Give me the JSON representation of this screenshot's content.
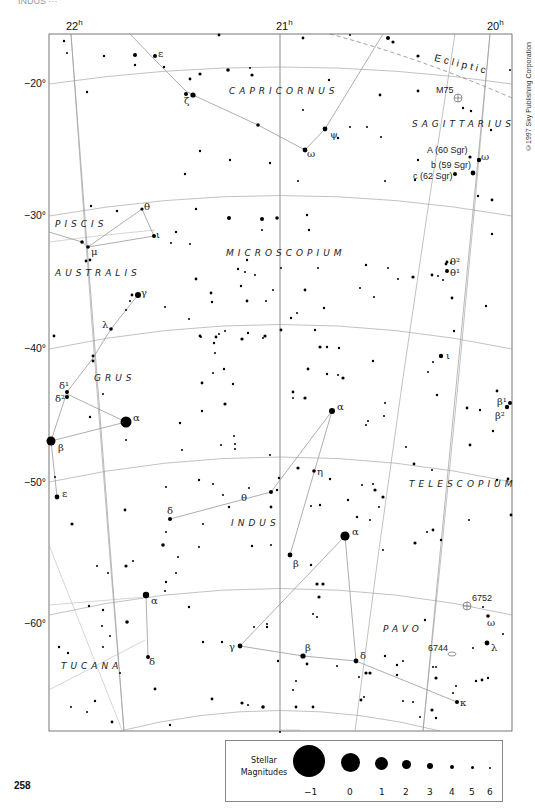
{
  "page": {
    "header_faint": "INDUS ···",
    "page_number": "258",
    "copyright": "©1997 Sky Publishing Corporation"
  },
  "axes": {
    "ra": [
      {
        "label": "22",
        "unit": "h"
      },
      {
        "label": "21",
        "unit": "h"
      },
      {
        "label": "20",
        "unit": "h"
      }
    ],
    "dec": [
      "−20°",
      "−30°",
      "−40°",
      "−50°",
      "−60°"
    ]
  },
  "ecliptic": {
    "label": "Ecliptic"
  },
  "constellations": [
    {
      "name": "CAPRICORNUS"
    },
    {
      "name": "SAGITTARIUS"
    },
    {
      "name": "PISCIS"
    },
    {
      "name": "AUSTRALIS"
    },
    {
      "name": "MICROSCOPIUM"
    },
    {
      "name": "GRUS"
    },
    {
      "name": "INDUS"
    },
    {
      "name": "TELESCOPIUM"
    },
    {
      "name": "TUCANA"
    },
    {
      "name": "PAVO"
    }
  ],
  "deep_sky": [
    {
      "name": "M75"
    },
    {
      "name": "6752"
    },
    {
      "name": "6744"
    }
  ],
  "star_labels": {
    "cap_epsilon": "ε",
    "cap_zeta": "ζ",
    "cap_psi": "ψ",
    "cap_omega": "ω",
    "sgr_A": "A (60 Sgr)",
    "sgr_b": "b (59 Sgr)",
    "sgr_c": "c (62 Sgr)",
    "sgr_omega": "ω",
    "psa_theta": "θ",
    "psa_iota": "ι",
    "psa_mu": "μ",
    "gru_gamma": "γ",
    "gru_lambda": "λ",
    "gru_delta1": "δ¹",
    "gru_delta2": "δ²",
    "gru_alpha": "α",
    "gru_beta": "β",
    "gru_epsilon": "ε",
    "mic_theta2": "θ²",
    "mic_theta1": "θ¹",
    "tel_iota": "ι",
    "sgr_beta1": "β¹",
    "sgr_beta2": "β²",
    "ind_alpha": "α",
    "ind_eta": "η",
    "ind_theta": "θ",
    "ind_delta": "δ",
    "ind_beta": "β",
    "tuc_alpha": "α",
    "tuc_delta": "δ",
    "pav_alpha": "α",
    "pav_gamma": "γ",
    "pav_beta": "β",
    "pav_delta": "δ",
    "pav_omega": "ω",
    "pav_lambda": "λ",
    "pav_kappa": "κ"
  },
  "legend": {
    "title_line1": "Stellar",
    "title_line2": "Magnitudes",
    "magnitudes": [
      "−1",
      "0",
      "1",
      "2",
      "3",
      "4",
      "5",
      "6"
    ]
  }
}
